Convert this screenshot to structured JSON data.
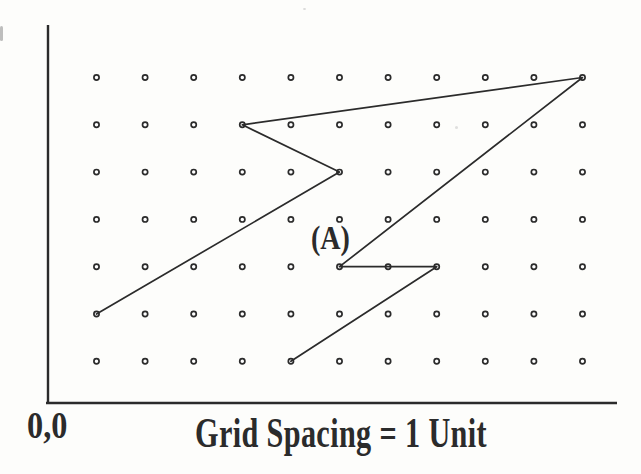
{
  "figure": {
    "caption": "Grid Spacing = 1 Unit",
    "origin_label": "0,0",
    "ink_color": "#2b2b2b",
    "paper_color": "#fdfdfb",
    "grid": {
      "cols": 11,
      "rows": 7,
      "x0": 96.5,
      "y0": 77.5,
      "dx": 48.6,
      "dy": 47.3,
      "dot_radius": 2.6,
      "dot_ring_width": 1.7,
      "dot_fill": "#ffffff"
    },
    "axes": {
      "y_axis": {
        "x": 48,
        "y1": 25,
        "y2": 403
      },
      "x_axis": {
        "y": 403,
        "x1": 46,
        "x2": 617
      },
      "stroke_width": 2.4
    },
    "path_A": {
      "label": "(A)",
      "points_units": [
        [
          1,
          2
        ],
        [
          6,
          5
        ],
        [
          4,
          6
        ],
        [
          11,
          7
        ],
        [
          6,
          3
        ],
        [
          8,
          3
        ],
        [
          5,
          1
        ]
      ],
      "stroke_width": 1.7
    }
  }
}
